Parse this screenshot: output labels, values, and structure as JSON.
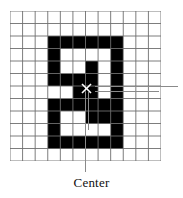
{
  "figure": {
    "caption": "Center",
    "center_marker_glyph": "x",
    "colors": {
      "shape_fill": "#000000",
      "grid_line": "#6e6e6e",
      "leader_line": "#8a8a8a",
      "background": "#ffffff",
      "caption_text": "#111111"
    }
  },
  "chart_data": {
    "type": "heatmap",
    "title": "",
    "subtitle": "",
    "xlabel": "",
    "ylabel": "",
    "grid": true,
    "legend": false,
    "columns": 12,
    "rows": 12,
    "cell_values_note": "1 = filled black cell, 0 = empty white cell; row 0 is top",
    "matrix": [
      [
        0,
        0,
        0,
        0,
        0,
        0,
        0,
        0,
        0,
        0,
        0,
        0
      ],
      [
        0,
        0,
        0,
        0,
        0,
        0,
        0,
        0,
        0,
        0,
        0,
        0
      ],
      [
        0,
        0,
        0,
        1,
        1,
        1,
        1,
        1,
        1,
        0,
        0,
        0
      ],
      [
        0,
        0,
        0,
        1,
        0,
        0,
        0,
        0,
        1,
        0,
        0,
        0
      ],
      [
        0,
        0,
        0,
        1,
        0,
        0,
        1,
        0,
        1,
        0,
        0,
        0
      ],
      [
        0,
        0,
        0,
        1,
        1,
        1,
        1,
        0,
        1,
        0,
        0,
        0
      ],
      [
        0,
        0,
        0,
        0,
        0,
        1,
        1,
        0,
        1,
        0,
        0,
        0
      ],
      [
        0,
        0,
        0,
        1,
        1,
        1,
        1,
        1,
        1,
        0,
        0,
        0
      ],
      [
        0,
        0,
        0,
        1,
        0,
        0,
        1,
        1,
        1,
        0,
        0,
        0
      ],
      [
        0,
        0,
        0,
        1,
        0,
        0,
        0,
        0,
        1,
        0,
        0,
        0
      ],
      [
        0,
        0,
        0,
        1,
        1,
        1,
        1,
        1,
        1,
        0,
        0,
        0
      ],
      [
        0,
        0,
        0,
        0,
        0,
        0,
        0,
        0,
        0,
        0,
        0,
        0
      ]
    ],
    "annotations": [
      {
        "name": "center-marker",
        "label": "x",
        "col": 6,
        "row": 6
      },
      {
        "name": "center-callout",
        "label": "Center",
        "target_col": 6,
        "target_row": 6
      }
    ]
  },
  "leaders": {
    "center_vertical": {
      "name": "center-leader-line"
    },
    "right_upper": {
      "name": "right-leader-line-upper"
    },
    "right_lower": {
      "name": "right-leader-line-lower"
    }
  }
}
